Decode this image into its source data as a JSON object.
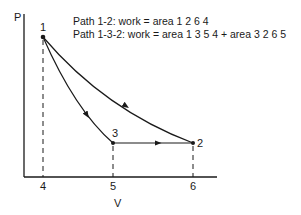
{
  "diagram": {
    "type": "PV diagram",
    "axes": {
      "y_label": "P",
      "x_label": "V",
      "x_ticks": [
        "4",
        "5",
        "6"
      ]
    },
    "points": [
      {
        "id": "1",
        "label": "1"
      },
      {
        "id": "2",
        "label": "2"
      },
      {
        "id": "3",
        "label": "3"
      }
    ],
    "paths": [
      {
        "id": "1-2",
        "from": "1",
        "to": "2",
        "shape": "curve"
      },
      {
        "id": "1-3",
        "from": "1",
        "to": "3",
        "shape": "curve"
      },
      {
        "id": "3-2",
        "from": "3",
        "to": "2",
        "shape": "horizontal line"
      }
    ],
    "captions": {
      "line1": "Path 1-2:  work = area 1 2 6 4",
      "line2": "Path 1-3-2:  work = area 1 3 5 4 + area 3 2 6 5"
    },
    "colors": {
      "ink": "#1a1a1a",
      "background": "#ffffff"
    }
  }
}
